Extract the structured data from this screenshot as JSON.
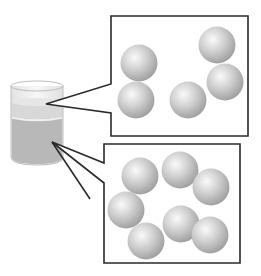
{
  "diagram": {
    "title": "",
    "colors": {
      "outline": "#2a2a2a",
      "beaker_glass": "#f4f4f4",
      "beaker_edge": "#bdbdbd",
      "upper_layer": "#d9d9d9",
      "upper_layer_band": "#e9e9e9",
      "lower_layer": "#b9b9b9",
      "sphere_light": "#f7f7f7",
      "sphere_mid": "#c8c8c8",
      "sphere_dark": "#9a9a9a"
    },
    "beaker": {
      "label": "",
      "layers": [
        {
          "name": "upper-layer",
          "label": ""
        },
        {
          "name": "lower-layer",
          "label": ""
        }
      ]
    },
    "callouts": [
      {
        "name": "upper-layer-callout",
        "label": "",
        "particle_count": 5,
        "particles": [
          {
            "cx": 139,
            "cy": 63
          },
          {
            "cx": 136,
            "cy": 100
          },
          {
            "cx": 188,
            "cy": 100
          },
          {
            "cx": 217,
            "cy": 45
          },
          {
            "cx": 225,
            "cy": 82
          }
        ]
      },
      {
        "name": "lower-layer-callout",
        "label": "",
        "particle_count": 7,
        "particles": [
          {
            "cx": 140,
            "cy": 176
          },
          {
            "cx": 180,
            "cy": 170
          },
          {
            "cx": 211,
            "cy": 187
          },
          {
            "cx": 126,
            "cy": 210
          },
          {
            "cx": 146,
            "cy": 241
          },
          {
            "cx": 181,
            "cy": 224
          },
          {
            "cx": 210,
            "cy": 235
          }
        ]
      }
    ],
    "particle_radius": 18.5
  }
}
